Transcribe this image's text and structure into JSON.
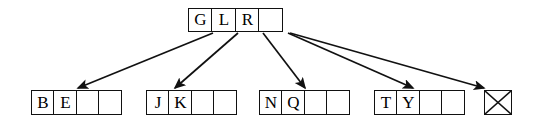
{
  "diagram": {
    "type": "tree",
    "colors": {
      "stroke": "#111111",
      "background": "#ffffff",
      "text": "#000000"
    },
    "root": {
      "name": "root-node",
      "x": 188,
      "y": 8,
      "cell_width": 25,
      "cell_height": 24,
      "cells": [
        {
          "label": "G",
          "empty": false
        },
        {
          "label": "L",
          "empty": false
        },
        {
          "label": "R",
          "empty": false
        },
        {
          "label": "",
          "empty": true
        }
      ]
    },
    "leaves": [
      {
        "name": "leaf-node-1",
        "x": 31,
        "y": 90,
        "cell_width": 24,
        "cell_height": 25,
        "cells": [
          {
            "label": "B",
            "empty": false
          },
          {
            "label": "E",
            "empty": false
          },
          {
            "label": "",
            "empty": true
          },
          {
            "label": "",
            "empty": true
          }
        ]
      },
      {
        "name": "leaf-node-2",
        "x": 146,
        "y": 90,
        "cell_width": 24,
        "cell_height": 25,
        "cells": [
          {
            "label": "J",
            "empty": false
          },
          {
            "label": "K",
            "empty": false
          },
          {
            "label": "",
            "empty": true
          },
          {
            "label": "",
            "empty": true
          }
        ]
      },
      {
        "name": "leaf-node-3",
        "x": 259,
        "y": 90,
        "cell_width": 24,
        "cell_height": 25,
        "cells": [
          {
            "label": "N",
            "empty": false
          },
          {
            "label": "Q",
            "empty": false
          },
          {
            "label": "",
            "empty": true
          },
          {
            "label": "",
            "empty": true
          }
        ]
      },
      {
        "name": "leaf-node-4",
        "x": 374,
        "y": 90,
        "cell_width": 24,
        "cell_height": 25,
        "cells": [
          {
            "label": "T",
            "empty": false
          },
          {
            "label": "Y",
            "empty": false
          },
          {
            "label": "",
            "empty": true
          },
          {
            "label": "",
            "empty": true
          }
        ]
      }
    ],
    "null_pointer": {
      "name": "null-pointer-box",
      "symbol": "crossed-box",
      "x": 484,
      "y": 90,
      "width": 28,
      "height": 25
    },
    "edges": [
      {
        "name": "edge-root-to-leaf-1",
        "x1": 213,
        "y1": 33,
        "x2": 78,
        "y2": 88
      },
      {
        "name": "edge-root-to-leaf-2",
        "x1": 238,
        "y1": 33,
        "x2": 175,
        "y2": 88
      },
      {
        "name": "edge-root-to-leaf-3",
        "x1": 263,
        "y1": 33,
        "x2": 305,
        "y2": 88
      },
      {
        "name": "edge-root-to-leaf-4",
        "x1": 288,
        "y1": 33,
        "x2": 413,
        "y2": 88
      },
      {
        "name": "edge-root-to-null-pointer",
        "x1": 290,
        "y1": 33,
        "x2": 484,
        "y2": 88
      }
    ]
  }
}
